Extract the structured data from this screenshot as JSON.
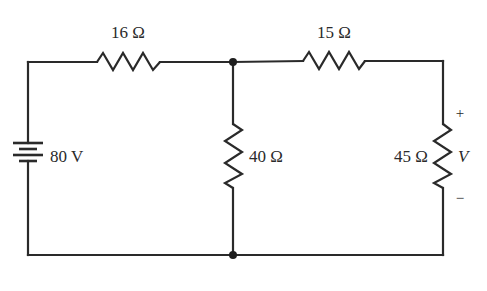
{
  "diagram": {
    "type": "electrical-circuit",
    "source": {
      "label": "80 V",
      "value_volts": 80
    },
    "resistors": [
      {
        "id": "r1",
        "label": "16 Ω",
        "ohms": 16,
        "position": "top-left-series"
      },
      {
        "id": "r2",
        "label": "15 Ω",
        "ohms": 15,
        "position": "top-right-series"
      },
      {
        "id": "r3",
        "label": "40 Ω",
        "ohms": 40,
        "position": "middle-shunt"
      },
      {
        "id": "r4",
        "label": "45 Ω",
        "ohms": 45,
        "position": "right-load"
      }
    ],
    "output": {
      "label": "V",
      "plus": "+",
      "minus": "−"
    },
    "nodes": 2
  }
}
